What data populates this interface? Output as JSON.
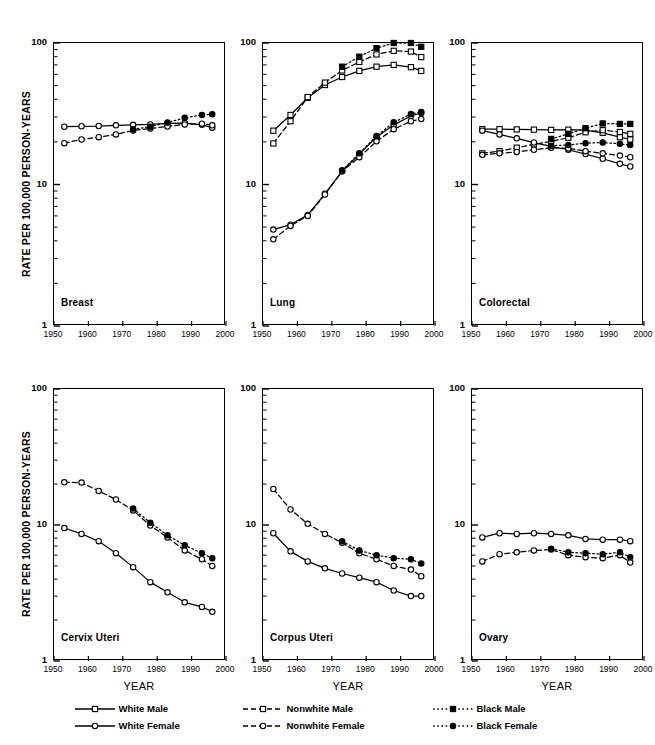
{
  "figure": {
    "ylabel": "RATE PER 100,000 PERSON-YEARS",
    "xlabel": "YEAR",
    "y_ticks": [
      "100",
      "10",
      "1"
    ],
    "x_ticks": [
      "1950",
      "1960",
      "1970",
      "1980",
      "1990",
      "2000"
    ]
  },
  "legend": {
    "items": [
      {
        "label": "White Male",
        "marker": "square-open",
        "line": "solid",
        "color": "#000000"
      },
      {
        "label": "Nonwhite Male",
        "marker": "square-open",
        "line": "dashed",
        "color": "#000000"
      },
      {
        "label": "Black Male",
        "marker": "square-filled",
        "line": "dotted",
        "color": "#000000"
      },
      {
        "label": "White Female",
        "marker": "circle-open",
        "line": "solid",
        "color": "#000000"
      },
      {
        "label": "Nonwhite Female",
        "marker": "circle-open",
        "line": "dashed",
        "color": "#000000"
      },
      {
        "label": "Black Female",
        "marker": "circle-filled",
        "line": "dotted",
        "color": "#000000"
      }
    ]
  },
  "chart_data": [
    {
      "type": "line",
      "title": "Breast",
      "xlabel": "YEAR",
      "ylabel": "RATE PER 100,000 PERSON-YEARS",
      "yscale": "log",
      "ylim": [
        1,
        100
      ],
      "xlim": [
        1950,
        2000
      ],
      "grid": false,
      "legend_position": "bottom",
      "series": [
        {
          "name": "White Female",
          "marker": "circle-open",
          "line": "solid",
          "x": [
            1953,
            1958,
            1963,
            1968,
            1973,
            1978,
            1983,
            1988,
            1993,
            1996
          ],
          "y": [
            25.6,
            25.8,
            25.9,
            26.2,
            26.4,
            26.6,
            27.0,
            27.2,
            26.4,
            25.2
          ]
        },
        {
          "name": "Nonwhite Female",
          "marker": "circle-open",
          "line": "dashed",
          "x": [
            1953,
            1958,
            1963,
            1968,
            1973,
            1978,
            1983,
            1988,
            1993,
            1996
          ],
          "y": [
            19.6,
            20.8,
            21.6,
            22.6,
            24.1,
            24.9,
            25.7,
            26.6,
            26.9,
            26.2
          ]
        },
        {
          "name": "Black Female",
          "marker": "circle-filled",
          "line": "dotted",
          "x": [
            1973,
            1978,
            1983,
            1988,
            1993,
            1996
          ],
          "y": [
            24.6,
            25.6,
            27.4,
            29.6,
            31.0,
            31.4
          ]
        }
      ]
    },
    {
      "type": "line",
      "title": "Lung",
      "xlabel": "YEAR",
      "ylabel": "RATE PER 100,000 PERSON-YEARS",
      "yscale": "log",
      "ylim": [
        1,
        100
      ],
      "xlim": [
        1950,
        2000
      ],
      "grid": false,
      "legend_position": "bottom",
      "series": [
        {
          "name": "White Male",
          "marker": "square-open",
          "line": "solid",
          "x": [
            1953,
            1958,
            1963,
            1968,
            1973,
            1978,
            1983,
            1988,
            1993,
            1996
          ],
          "y": [
            24.0,
            31.0,
            41.0,
            50.5,
            57.5,
            63.5,
            68.0,
            70.0,
            67.5,
            63.5
          ]
        },
        {
          "name": "Nonwhite Male",
          "marker": "square-open",
          "line": "dashed",
          "x": [
            1953,
            1958,
            1963,
            1968,
            1973,
            1978,
            1983,
            1988,
            1993,
            1996
          ],
          "y": [
            19.5,
            28.0,
            41.5,
            52.5,
            64.0,
            73.5,
            83.0,
            88.0,
            87.0,
            79.5
          ]
        },
        {
          "name": "Black Male",
          "marker": "square-filled",
          "line": "dotted",
          "x": [
            1973,
            1978,
            1983,
            1988,
            1993,
            1996
          ],
          "y": [
            68.0,
            80.0,
            92.0,
            100.0,
            100.0,
            94.0
          ]
        },
        {
          "name": "White Female",
          "marker": "circle-open",
          "line": "solid",
          "x": [
            1953,
            1958,
            1963,
            1968,
            1973,
            1978,
            1983,
            1988,
            1993,
            1996
          ],
          "y": [
            4.8,
            5.2,
            6.1,
            8.6,
            12.4,
            16.4,
            21.6,
            26.4,
            30.5,
            32.0
          ]
        },
        {
          "name": "Nonwhite Female",
          "marker": "circle-open",
          "line": "dashed",
          "x": [
            1953,
            1958,
            1963,
            1968,
            1973,
            1978,
            1983,
            1988,
            1993,
            1996
          ],
          "y": [
            4.1,
            5.1,
            6.0,
            8.5,
            12.4,
            15.6,
            20.2,
            24.6,
            28.0,
            29.0
          ]
        },
        {
          "name": "Black Female",
          "marker": "circle-filled",
          "line": "dotted",
          "x": [
            1973,
            1978,
            1983,
            1988,
            1993,
            1996
          ],
          "y": [
            12.6,
            16.6,
            22.0,
            27.5,
            31.5,
            32.6
          ]
        }
      ]
    },
    {
      "type": "line",
      "title": "Colorectal",
      "xlabel": "YEAR",
      "ylabel": "RATE PER 100,000 PERSON-YEARS",
      "yscale": "log",
      "ylim": [
        1,
        100
      ],
      "xlim": [
        1950,
        2000
      ],
      "grid": false,
      "legend_position": "bottom",
      "series": [
        {
          "name": "White Male",
          "marker": "square-open",
          "line": "solid",
          "x": [
            1953,
            1958,
            1963,
            1968,
            1973,
            1978,
            1983,
            1988,
            1993,
            1996
          ],
          "y": [
            24.6,
            24.6,
            24.5,
            24.4,
            24.3,
            24.4,
            24.2,
            23.2,
            21.6,
            20.8
          ]
        },
        {
          "name": "Nonwhite Male",
          "marker": "square-open",
          "line": "dashed",
          "x": [
            1953,
            1958,
            1963,
            1968,
            1973,
            1978,
            1983,
            1988,
            1993,
            1996
          ],
          "y": [
            16.6,
            17.2,
            18.2,
            19.2,
            20.2,
            21.4,
            23.4,
            24.2,
            23.5,
            22.8
          ]
        },
        {
          "name": "Black Male",
          "marker": "square-filled",
          "line": "dotted",
          "x": [
            1973,
            1978,
            1983,
            1988,
            1993,
            1996
          ],
          "y": [
            21.0,
            22.8,
            25.0,
            27.0,
            26.8,
            26.8
          ]
        },
        {
          "name": "White Female",
          "marker": "circle-open",
          "line": "solid",
          "x": [
            1953,
            1958,
            1963,
            1968,
            1973,
            1978,
            1983,
            1988,
            1993,
            1996
          ],
          "y": [
            24.0,
            22.6,
            21.2,
            19.8,
            18.6,
            17.6,
            16.4,
            15.2,
            14.0,
            13.4
          ]
        },
        {
          "name": "Nonwhite Female",
          "marker": "circle-open",
          "line": "dashed",
          "x": [
            1953,
            1958,
            1963,
            1968,
            1973,
            1978,
            1983,
            1988,
            1993,
            1996
          ],
          "y": [
            16.2,
            16.6,
            17.0,
            17.6,
            18.2,
            18.0,
            17.2,
            16.6,
            16.0,
            15.6
          ]
        },
        {
          "name": "Black Female",
          "marker": "circle-filled",
          "line": "dotted",
          "x": [
            1973,
            1978,
            1983,
            1988,
            1993,
            1996
          ],
          "y": [
            18.8,
            19.0,
            19.6,
            19.8,
            19.4,
            19.0
          ]
        }
      ]
    },
    {
      "type": "line",
      "title": "Cervix Uteri",
      "xlabel": "YEAR",
      "ylabel": "RATE PER 100,000 PERSON-YEARS",
      "yscale": "log",
      "ylim": [
        1,
        100
      ],
      "xlim": [
        1950,
        2000
      ],
      "grid": false,
      "legend_position": "bottom",
      "series": [
        {
          "name": "White Female",
          "marker": "circle-open",
          "line": "solid",
          "x": [
            1953,
            1958,
            1963,
            1968,
            1973,
            1978,
            1983,
            1988,
            1993,
            1996
          ],
          "y": [
            9.5,
            8.6,
            7.6,
            6.2,
            4.9,
            3.8,
            3.2,
            2.7,
            2.5,
            2.3
          ]
        },
        {
          "name": "Nonwhite Female",
          "marker": "circle-open",
          "line": "dashed",
          "x": [
            1953,
            1958,
            1963,
            1968,
            1973,
            1978,
            1983,
            1988,
            1993,
            1996
          ],
          "y": [
            20.6,
            20.5,
            17.8,
            15.4,
            12.8,
            9.9,
            8.1,
            6.5,
            5.6,
            5.0
          ]
        },
        {
          "name": "Black Female",
          "marker": "circle-filled",
          "line": "dotted",
          "x": [
            1973,
            1978,
            1983,
            1988,
            1993,
            1996
          ],
          "y": [
            13.2,
            10.4,
            8.4,
            7.1,
            6.2,
            5.7
          ]
        }
      ]
    },
    {
      "type": "line",
      "title": "Corpus Uteri",
      "xlabel": "YEAR",
      "ylabel": "RATE PER 100,000 PERSON-YEARS",
      "yscale": "log",
      "ylim": [
        1,
        100
      ],
      "xlim": [
        1950,
        2000
      ],
      "grid": false,
      "legend_position": "bottom",
      "series": [
        {
          "name": "White Female",
          "marker": "circle-open",
          "line": "solid",
          "x": [
            1953,
            1958,
            1963,
            1968,
            1973,
            1978,
            1983,
            1988,
            1993,
            1996
          ],
          "y": [
            8.7,
            6.4,
            5.4,
            4.8,
            4.4,
            4.1,
            3.8,
            3.3,
            3.0,
            3.0
          ]
        },
        {
          "name": "Nonwhite Female",
          "marker": "circle-open",
          "line": "dashed",
          "x": [
            1953,
            1958,
            1963,
            1968,
            1973,
            1978,
            1983,
            1988,
            1993,
            1996
          ],
          "y": [
            18.4,
            13.0,
            10.2,
            8.6,
            7.4,
            6.2,
            5.6,
            5.0,
            4.7,
            4.2
          ]
        },
        {
          "name": "Black Female",
          "marker": "circle-filled",
          "line": "dotted",
          "x": [
            1973,
            1978,
            1983,
            1988,
            1993,
            1996
          ],
          "y": [
            7.6,
            6.5,
            6.0,
            5.7,
            5.6,
            5.2
          ]
        }
      ]
    },
    {
      "type": "line",
      "title": "Ovary",
      "xlabel": "YEAR",
      "ylabel": "RATE PER 100,000 PERSON-YEARS",
      "yscale": "log",
      "ylim": [
        1,
        100
      ],
      "xlim": [
        1950,
        2000
      ],
      "grid": false,
      "legend_position": "bottom",
      "series": [
        {
          "name": "White Female",
          "marker": "circle-open",
          "line": "solid",
          "x": [
            1953,
            1958,
            1963,
            1968,
            1973,
            1978,
            1983,
            1988,
            1993,
            1996
          ],
          "y": [
            8.1,
            8.7,
            8.6,
            8.7,
            8.6,
            8.4,
            7.9,
            7.8,
            7.8,
            7.6
          ]
        },
        {
          "name": "Nonwhite Female",
          "marker": "circle-open",
          "line": "dashed",
          "x": [
            1953,
            1958,
            1963,
            1968,
            1973,
            1978,
            1983,
            1988,
            1993,
            1996
          ],
          "y": [
            5.4,
            6.1,
            6.3,
            6.5,
            6.6,
            6.0,
            5.8,
            5.7,
            6.0,
            5.3
          ]
        },
        {
          "name": "Black Female",
          "marker": "circle-filled",
          "line": "dotted",
          "x": [
            1973,
            1978,
            1983,
            1988,
            1993,
            1996
          ],
          "y": [
            6.7,
            6.3,
            6.2,
            6.1,
            6.3,
            5.8
          ]
        }
      ]
    }
  ]
}
